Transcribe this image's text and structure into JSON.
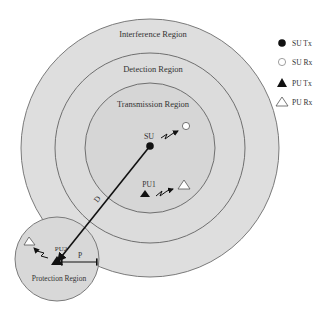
{
  "diagram": {
    "regions": {
      "interference": "Interference Region",
      "detection": "Detection Region",
      "transmission": "Transmission Region",
      "protection": "Protection Region"
    },
    "nodes": {
      "su": "SU",
      "pu1": "PU1",
      "pu2": "PU2"
    },
    "distances": {
      "d": "D",
      "p": "P"
    },
    "legend": [
      {
        "icon": "filled-circle",
        "label": "SU Tx"
      },
      {
        "icon": "hollow-circle",
        "label": "SU Rx"
      },
      {
        "icon": "filled-triangle",
        "label": "PU Tx"
      },
      {
        "icon": "hollow-triangle",
        "label": "PU Rx"
      }
    ],
    "colors": {
      "region_fill": "#dedede",
      "transmission_fill": "#d6d6d6",
      "protection_fill": "#d8d8d8",
      "stroke": "#7a7a7a",
      "node": "#111111"
    }
  }
}
